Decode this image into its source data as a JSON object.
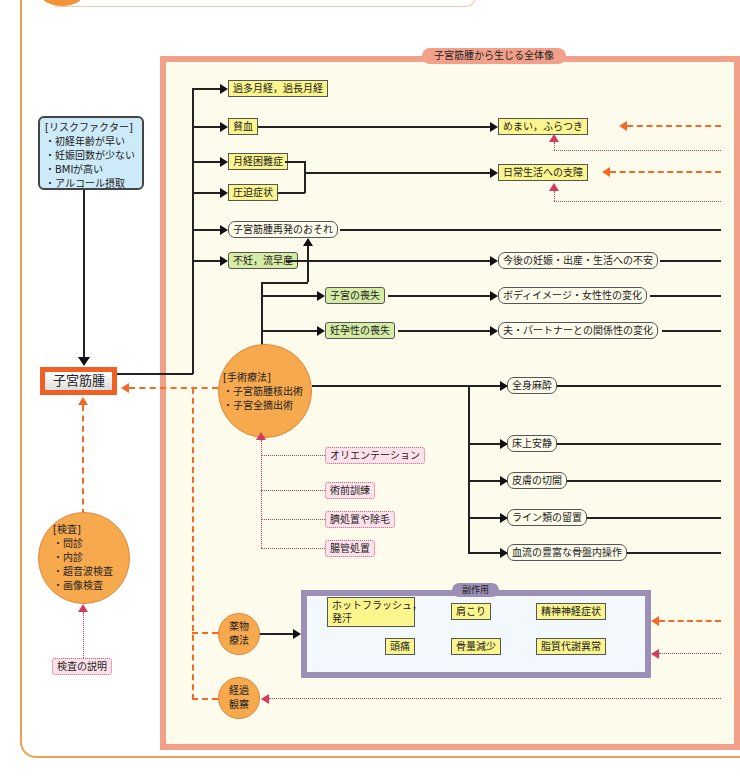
{
  "panel": {
    "title": "子宮筋腫から生じる全体像"
  },
  "risk": {
    "title": "[リスクファクター]",
    "items": [
      "・初経年齢が早い",
      "・妊娠回数が少ない",
      "・BMIが高い",
      "・アルコール摂取"
    ]
  },
  "main_node": {
    "label": "子宮筋腫"
  },
  "symptoms": {
    "s1": "過多月経，過長月経",
    "s2": "貧血",
    "s3": "月経困難症",
    "s4": "圧迫症状",
    "s5": "子宮筋腫再発のおそれ",
    "s6": "不妊，流早産"
  },
  "effects": {
    "dizziness": "めまい，ふらつき",
    "daily_life": "日常生活への支障",
    "anxiety": "今後の妊娠・出産・生活への不安",
    "body_image": "ボディイメージ・女性性の変化",
    "partner": "夫・パートナーとの関係性の変化"
  },
  "losses": {
    "uterus": "子宮の喪失",
    "fertility": "妊孕性の喪失"
  },
  "surgery": {
    "title": "[手術療法]",
    "items": [
      "・子宮筋腫核出術",
      "・子宮全摘出術"
    ]
  },
  "surgery_effects": [
    "全身麻酔",
    "床上安静",
    "皮膚の切開",
    "ライン類の留置",
    "血流の豊富な骨盤内操作"
  ],
  "preop": [
    "オリエンテーション",
    "術前訓練",
    "臍処置や除毛",
    "腸管処置"
  ],
  "exam": {
    "title": "[検査]",
    "items": [
      "・問診",
      "・内診",
      "・超音波検査",
      "・画像検査"
    ],
    "explain": "検査の説明"
  },
  "drug": {
    "label_line1": "薬物",
    "label_line2": "療法"
  },
  "observe": {
    "label_line1": "経過",
    "label_line2": "観察"
  },
  "side_effects": {
    "title": "副作用",
    "items": [
      "ホットフラッシュ，",
      "発汗",
      "肩こり",
      "精神神経症状",
      "頭痛",
      "骨量減少",
      "脂質代謝異常"
    ]
  }
}
